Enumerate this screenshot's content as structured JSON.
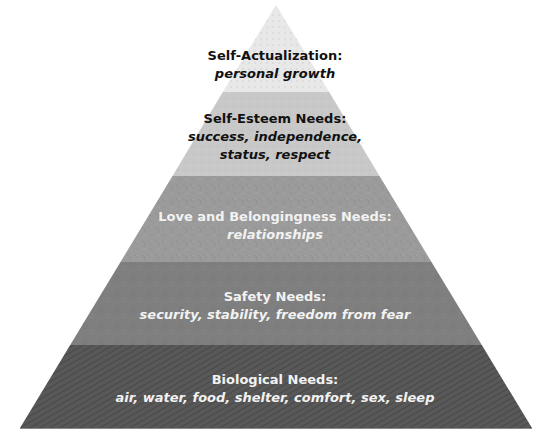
{
  "diagram": {
    "type": "pyramid",
    "apex": [
      276,
      5
    ],
    "base": {
      "left": 20,
      "right": 532,
      "y": 428
    },
    "layers": [
      {
        "id": "self-actualization",
        "title": "Self-Actualization:",
        "description": "personal growth",
        "fill": "#e6e6e6",
        "text_color": "dark",
        "y_top": 5,
        "y_bottom": 92
      },
      {
        "id": "self-esteem",
        "title": "Self-Esteem Needs:",
        "description_lines": [
          "success, independence,",
          "status, respect"
        ],
        "fill": "#c9c9c9",
        "text_color": "dark",
        "y_top": 92,
        "y_bottom": 176
      },
      {
        "id": "love-belonging",
        "title": "Love and Belongingness Needs:",
        "description": "relationships",
        "fill": "#9a9a9a",
        "text_color": "light",
        "y_top": 176,
        "y_bottom": 262
      },
      {
        "id": "safety",
        "title": "Safety Needs:",
        "description": "security, stability, freedom from fear",
        "fill": "#7f7f7f",
        "text_color": "light",
        "y_top": 262,
        "y_bottom": 345
      },
      {
        "id": "biological",
        "title": "Biological Needs:",
        "description": "air, water, food, shelter, comfort, sex, sleep",
        "fill": "#575757",
        "text_color": "light",
        "y_top": 345,
        "y_bottom": 428
      }
    ]
  }
}
